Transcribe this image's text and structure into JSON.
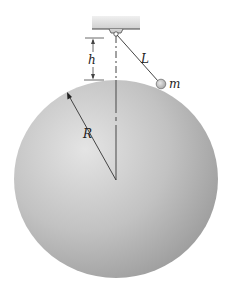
{
  "diagram": {
    "labels": {
      "length": "L",
      "mass": "m",
      "height": "h",
      "radius": "R"
    },
    "colors": {
      "sphere_light": "#e6e6e6",
      "sphere_dark": "#9c9c9c",
      "line": "#3a3a3a",
      "support": "#d9d9d9",
      "mass": "#bdbdbd"
    }
  }
}
